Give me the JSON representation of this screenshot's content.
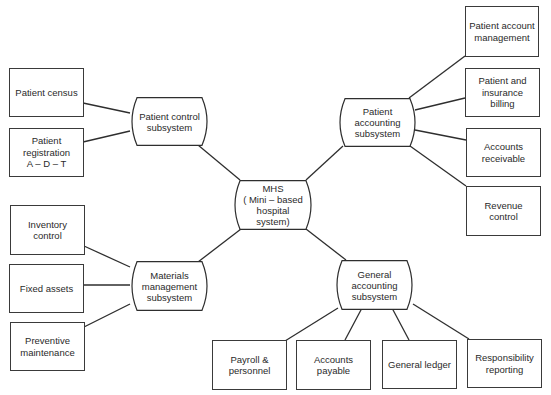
{
  "diagram": {
    "center": {
      "id": "mhs",
      "label": "MHS\n( Mini – based\nhospital\nsystem)"
    },
    "subsystems": [
      {
        "id": "patient-control",
        "label": "Patient control\nsubsystem"
      },
      {
        "id": "patient-accounting",
        "label": "Patient\naccounting\nsubsystem"
      },
      {
        "id": "materials-management",
        "label": "Materials\nmanagement\nsubsystem"
      },
      {
        "id": "general-accounting",
        "label": "General\naccounting\nsubsystem"
      }
    ],
    "modules": [
      {
        "id": "patient-census",
        "parent": "patient-control",
        "label": "Patient census"
      },
      {
        "id": "patient-registration",
        "parent": "patient-control",
        "label": "Patient\nregistration\nA – D – T"
      },
      {
        "id": "patient-account-management",
        "parent": "patient-accounting",
        "label": "Patient account\nmanagement"
      },
      {
        "id": "patient-insurance-billing",
        "parent": "patient-accounting",
        "label": "Patient and\ninsurance\nbilling"
      },
      {
        "id": "accounts-receivable",
        "parent": "patient-accounting",
        "label": "Accounts\nreceivable"
      },
      {
        "id": "revenue-control",
        "parent": "patient-accounting",
        "label": "Revenue\ncontrol"
      },
      {
        "id": "inventory-control",
        "parent": "materials-management",
        "label": "Inventory\ncontrol"
      },
      {
        "id": "fixed-assets",
        "parent": "materials-management",
        "label": "Fixed assets"
      },
      {
        "id": "preventive-maintenance",
        "parent": "materials-management",
        "label": "Preventive\nmaintenance"
      },
      {
        "id": "payroll-personnel",
        "parent": "general-accounting",
        "label": "Payroll &\npersonnel"
      },
      {
        "id": "accounts-payable",
        "parent": "general-accounting",
        "label": "Accounts\npayable"
      },
      {
        "id": "general-ledger",
        "parent": "general-accounting",
        "label": "General ledger"
      },
      {
        "id": "responsibility-reporting",
        "parent": "general-accounting",
        "label": "Responsibility\nreporting"
      }
    ],
    "colors": {
      "line": "#2e2e2e",
      "text": "#2a2a2a",
      "background": "#ffffff"
    }
  }
}
